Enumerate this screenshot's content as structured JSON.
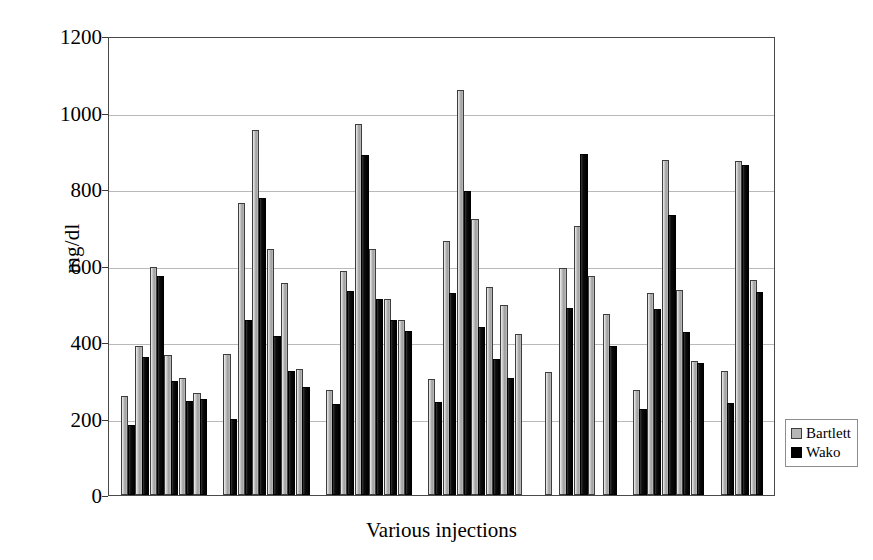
{
  "chart_data": {
    "type": "bar",
    "title": "",
    "xlabel": "Various injections",
    "ylabel": "mg/dl",
    "ylim": [
      0,
      1200
    ],
    "yticks": [
      0,
      200,
      400,
      600,
      800,
      1000,
      1200
    ],
    "ytick_labels": [
      "0",
      "200",
      "400",
      "600",
      "800",
      "1000",
      "1200"
    ],
    "grid": true,
    "xticks_visible": false,
    "legend_position": "right",
    "series": [
      {
        "name": "Bartlett",
        "color": "#b5b5b5",
        "values": [
          258,
          390,
          595,
          367,
          305,
          268,
          368,
          763,
          955,
          643,
          553,
          330,
          274,
          585,
          970,
          643,
          513,
          458,
          303,
          663,
          1058,
          722,
          545,
          498,
          422,
          322,
          593,
          703,
          573,
          472,
          275,
          527,
          875,
          535,
          350,
          325,
          872,
          562
        ]
      },
      {
        "name": "Wako",
        "color": "#000000",
        "values": [
          182,
          362,
          573,
          297,
          247,
          252,
          198,
          458,
          777,
          415,
          325,
          283,
          238,
          533,
          888,
          513,
          457,
          430,
          243,
          528,
          795,
          438,
          355,
          305,
          null,
          null,
          488,
          892,
          null,
          390,
          225,
          487,
          733,
          425,
          345,
          240,
          862,
          532
        ]
      }
    ],
    "groups": [
      {
        "label": "group-1",
        "pairs": 6
      },
      {
        "label": "group-2",
        "pairs": 6
      },
      {
        "label": "group-3",
        "pairs": 6
      },
      {
        "label": "group-4",
        "pairs": 7
      },
      {
        "label": "group-5",
        "pairs": 5
      },
      {
        "label": "group-6",
        "pairs": 5
      },
      {
        "label": "group-7",
        "pairs": 3
      }
    ]
  },
  "legend": {
    "items": [
      {
        "label": "Bartlett",
        "swatch": "bartlett"
      },
      {
        "label": "Wako",
        "swatch": "wako"
      }
    ]
  },
  "axes": {
    "y_title": "mg/dl",
    "x_title": "Various injections"
  }
}
